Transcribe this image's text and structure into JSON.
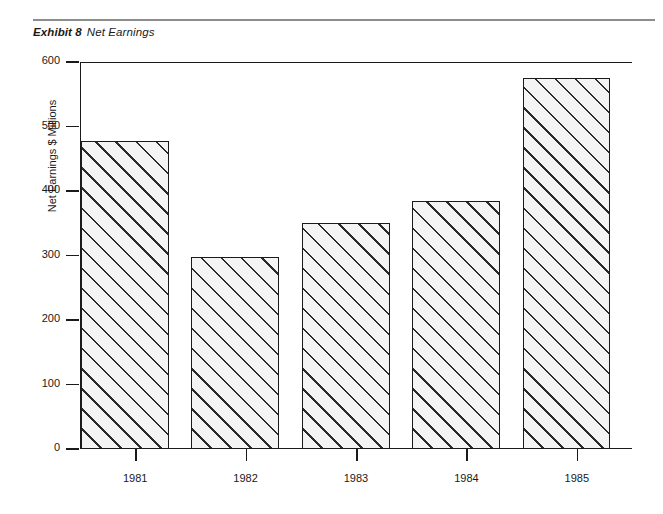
{
  "exhibit": {
    "label": "Exhibit 8",
    "title": "Net Earnings"
  },
  "chart_data": {
    "type": "bar",
    "title": "Net Earnings",
    "categories": [
      "1981",
      "1982",
      "1983",
      "1984",
      "1985"
    ],
    "values": [
      478,
      297,
      350,
      385,
      575
    ],
    "xlabel": "",
    "ylabel": "Net Earnings $ Millions",
    "ylim": [
      0,
      600
    ],
    "ytick_labels": [
      "0",
      "100",
      "200",
      "300",
      "400",
      "500",
      "600"
    ],
    "ytick_values": [
      0,
      100,
      200,
      300,
      400,
      500,
      600
    ],
    "grid": false,
    "legend": null,
    "series": [
      {
        "name": "Net Earnings",
        "values": [
          478,
          297,
          350,
          385,
          575
        ]
      }
    ],
    "bar_style": {
      "fill": "#f4f4f4",
      "hatch": "diagonal-45",
      "edge_color": "#1a1a1a"
    }
  },
  "style": {
    "rule_color": "#8d8d8d",
    "axis_color": "#1a1a1a",
    "background": "#ffffff"
  }
}
